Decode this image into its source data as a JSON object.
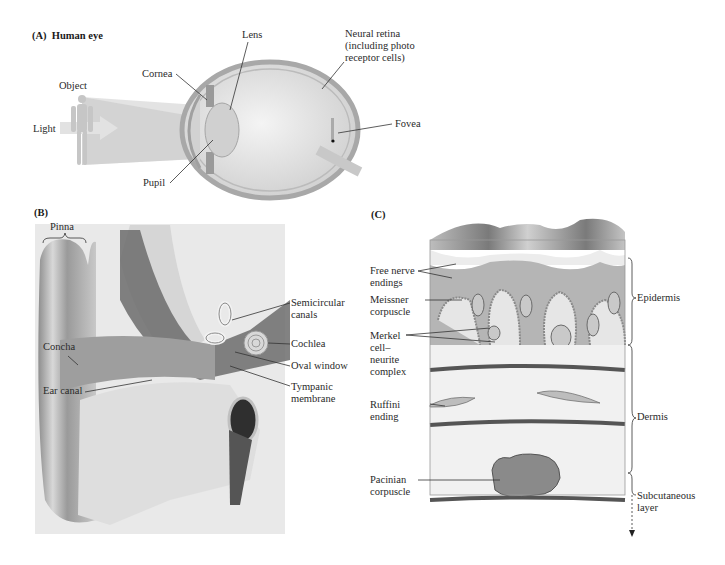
{
  "figure": {
    "panels": [
      {
        "id": "A",
        "label": "(A)  Human eye",
        "callouts": {
          "object": "Object",
          "light": "Light",
          "cornea": "Cornea",
          "lens": "Lens",
          "pupil": "Pupil",
          "neural_retina": "Neural retina\n(including photo\nreceptor cells)",
          "fovea": "Fovea"
        }
      },
      {
        "id": "B",
        "label": "(B)",
        "callouts": {
          "pinna": "Pinna",
          "concha": "Concha",
          "ear_canal": "Ear canal",
          "semicircular_canals": "Semicircular\ncanals",
          "cochlea": "Cochlea",
          "oval_window": "Oval window",
          "tympanic_membrane": "Tympanic\nmembrane"
        }
      },
      {
        "id": "C",
        "label": "(C)",
        "callouts": {
          "free_nerve_endings": "Free nerve\nendings",
          "meissner_corpuscle": "Meissner\ncorpuscle",
          "merkel_complex": "Merkel\ncell–\nneurite\ncomplex",
          "ruffini_ending": "Ruffini\nending",
          "pacinian_corpuscle": "Pacinian\ncorpuscle",
          "epidermis": "Epidermis",
          "dermis": "Dermis",
          "subcutaneous_layer": "Subcutaneous\nlayer"
        }
      }
    ]
  },
  "colors": {
    "tissue_gray": "#b8b8b8",
    "light_gray": "#d9d9d9",
    "dark_gray": "#5a5a5a",
    "line": "#333333"
  }
}
